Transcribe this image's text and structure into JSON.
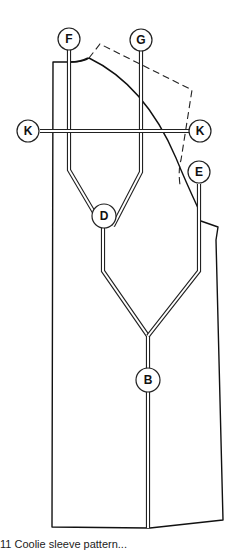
{
  "figure": {
    "type": "pattern-diagram",
    "labels": {
      "F": "F",
      "G": "G",
      "K_left": "K",
      "K_right": "K",
      "E": "E",
      "D": "D",
      "B": "B"
    },
    "caption": "11   Coolie sleeve pattern..."
  }
}
